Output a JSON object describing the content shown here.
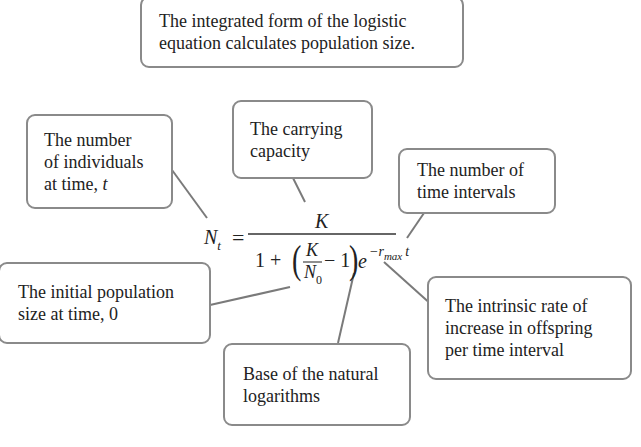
{
  "title": {
    "lines": [
      "The integrated form of the logistic",
      "equation calculates population size."
    ]
  },
  "equation": {
    "lhs": "N",
    "lhs_sub": "t",
    "equals": "=",
    "numerator": "K",
    "denominator": {
      "one": "1 +",
      "open_paren": "(",
      "frac_num": "K",
      "frac_den": "N",
      "frac_den_sub": "0",
      "minus_one": "− 1",
      "close_paren": ")",
      "base": "e",
      "exponent": "−r",
      "exponent_sub": "max",
      "exponent_t": "t"
    }
  },
  "callouts": [
    {
      "id": "nt",
      "lines": [
        "The number",
        "of individuals",
        "at time, "
      ],
      "italic_tail": "t"
    },
    {
      "id": "k",
      "lines": [
        "The carrying",
        "capacity"
      ]
    },
    {
      "id": "t",
      "lines": [
        "The number of",
        "time intervals"
      ]
    },
    {
      "id": "n0",
      "lines": [
        "The initial population",
        "size at time, 0"
      ]
    },
    {
      "id": "e",
      "lines": [
        "Base of the natural",
        "logarithms"
      ]
    },
    {
      "id": "r",
      "lines": [
        "The intrinsic rate of",
        "increase in offspring",
        "per time interval"
      ]
    }
  ],
  "colors": {
    "border": "#8a8a8a",
    "leader_line": "#7a7a7a",
    "text": "#222222"
  }
}
